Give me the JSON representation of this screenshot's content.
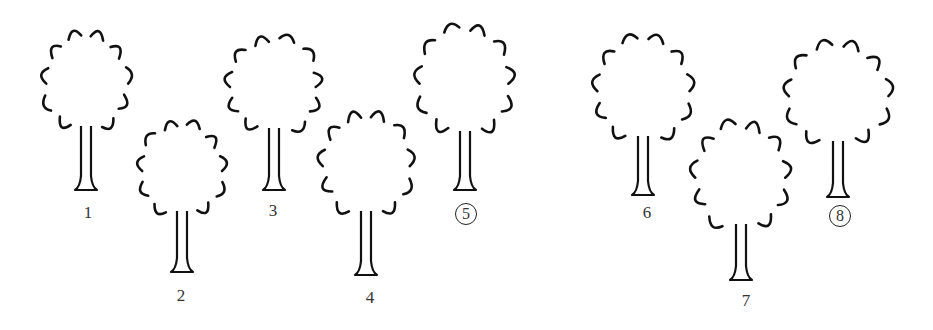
{
  "figure": {
    "trees": [
      {
        "label": "1",
        "circled": false,
        "x": 86,
        "crownTop": 35,
        "crownBottom": 130,
        "crownHalfWidth": 40,
        "trunkBottom": 190
      },
      {
        "label": "2",
        "circled": false,
        "x": 182,
        "crownTop": 125,
        "crownBottom": 215,
        "crownHalfWidth": 40,
        "trunkBottom": 272
      },
      {
        "label": "3",
        "circled": false,
        "x": 274,
        "crownTop": 40,
        "crownBottom": 132,
        "crownHalfWidth": 44,
        "trunkBottom": 190
      },
      {
        "label": "4",
        "circled": false,
        "x": 366,
        "crownTop": 115,
        "crownBottom": 215,
        "crownHalfWidth": 43,
        "trunkBottom": 275
      },
      {
        "label": "5",
        "circled": true,
        "x": 465,
        "crownTop": 30,
        "crownBottom": 135,
        "crownHalfWidth": 45,
        "trunkBottom": 190
      },
      {
        "label": "6",
        "circled": false,
        "x": 643,
        "crownTop": 40,
        "crownBottom": 140,
        "crownHalfWidth": 45,
        "trunkBottom": 195
      },
      {
        "label": "7",
        "circled": false,
        "x": 741,
        "crownTop": 125,
        "crownBottom": 228,
        "crownHalfWidth": 45,
        "trunkBottom": 280
      },
      {
        "label": "8",
        "circled": true,
        "x": 838,
        "crownTop": 45,
        "crownBottom": 145,
        "crownHalfWidth": 48,
        "trunkBottom": 197
      }
    ],
    "labelPositions": [
      {
        "x": 88,
        "y": 203
      },
      {
        "x": 181,
        "y": 286
      },
      {
        "x": 273,
        "y": 201
      },
      {
        "x": 370,
        "y": 288
      },
      {
        "x": 466,
        "y": 203
      },
      {
        "x": 647,
        "y": 203
      },
      {
        "x": 746,
        "y": 291
      },
      {
        "x": 840,
        "y": 205
      }
    ],
    "colors": {
      "ink": "#111111",
      "labelText": "#333333",
      "background": "#ffffff"
    }
  }
}
